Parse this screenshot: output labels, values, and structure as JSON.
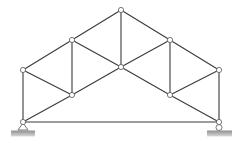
{
  "diagram": {
    "type": "roof-truss",
    "colors": {
      "member": "#3a3a3a",
      "node_fill": "#ffffff",
      "node_stroke": "#555555",
      "ground_top": "#9a9a9a",
      "ground_bottom": "#d8d8d8"
    },
    "nodes": [
      {
        "id": "A",
        "x": 23,
        "y": 122,
        "role": "left-support"
      },
      {
        "id": "B",
        "x": 23,
        "y": 70,
        "role": "left-eave"
      },
      {
        "id": "C",
        "x": 72,
        "y": 40,
        "role": "upper-left"
      },
      {
        "id": "D",
        "x": 121,
        "y": 10,
        "role": "apex"
      },
      {
        "id": "E",
        "x": 170,
        "y": 40,
        "role": "upper-right"
      },
      {
        "id": "F",
        "x": 219,
        "y": 70,
        "role": "right-eave"
      },
      {
        "id": "G",
        "x": 219,
        "y": 122,
        "role": "right-support"
      },
      {
        "id": "H",
        "x": 72,
        "y": 95,
        "role": "lower-left"
      },
      {
        "id": "I",
        "x": 121,
        "y": 67,
        "role": "center"
      },
      {
        "id": "J",
        "x": 170,
        "y": 95,
        "role": "lower-right"
      }
    ],
    "members": [
      [
        "A",
        "B"
      ],
      [
        "B",
        "C"
      ],
      [
        "C",
        "D"
      ],
      [
        "D",
        "E"
      ],
      [
        "E",
        "F"
      ],
      [
        "F",
        "G"
      ],
      [
        "A",
        "G"
      ],
      [
        "A",
        "H"
      ],
      [
        "H",
        "I"
      ],
      [
        "I",
        "J"
      ],
      [
        "J",
        "G"
      ],
      [
        "B",
        "H"
      ],
      [
        "C",
        "H"
      ],
      [
        "C",
        "I"
      ],
      [
        "D",
        "I"
      ],
      [
        "E",
        "I"
      ],
      [
        "E",
        "J"
      ],
      [
        "F",
        "J"
      ]
    ],
    "supports": [
      {
        "node": "A",
        "type": "pin",
        "ground_x": 11,
        "ground_w": 24
      },
      {
        "node": "G",
        "type": "roller",
        "ground_x": 207,
        "ground_w": 25
      }
    ]
  }
}
